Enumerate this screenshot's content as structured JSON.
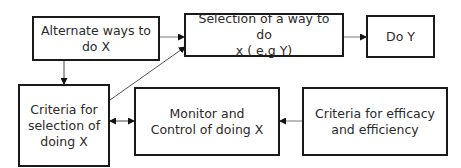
{
  "diagram": {
    "type": "flowchart",
    "nodes": [
      {
        "id": "alt",
        "label": "Alternate ways to do X"
      },
      {
        "id": "sel",
        "label": "Selection of a way to do x ( e.g Y)"
      },
      {
        "id": "doy",
        "label": "Do Y"
      },
      {
        "id": "crit",
        "label": "Criteria for selection of doing X"
      },
      {
        "id": "mon",
        "label": "Monitor and Control of doing X"
      },
      {
        "id": "eff",
        "label": "Criteria for efficacy and efficiency"
      }
    ],
    "edges": [
      {
        "from": "alt",
        "to": "sel",
        "direction": "forward"
      },
      {
        "from": "sel",
        "to": "doy",
        "direction": "forward"
      },
      {
        "from": "alt",
        "to": "crit",
        "direction": "forward"
      },
      {
        "from": "crit",
        "to": "sel",
        "direction": "forward"
      },
      {
        "from": "crit",
        "to": "mon",
        "direction": "both"
      },
      {
        "from": "eff",
        "to": "mon",
        "direction": "forward"
      }
    ],
    "lines": {
      "alt": [
        "Alternate ways to",
        "do X"
      ],
      "sel": [
        "Selection of a way to do",
        "x ( e.g Y)"
      ],
      "doy": [
        "Do Y"
      ],
      "crit": [
        "Criteria for",
        "selection of",
        "doing X"
      ],
      "mon": [
        "Monitor and",
        "Control of doing X"
      ],
      "eff": [
        "Criteria for efficacy",
        "and efficiency"
      ]
    }
  }
}
